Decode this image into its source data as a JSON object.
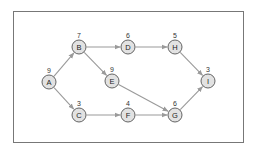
{
  "diagram": {
    "type": "directed-graph",
    "frame": {
      "x": 13,
      "y": 11,
      "width": 230,
      "height": 131
    },
    "colors": {
      "node_fill": "#e2e2e2",
      "node_stroke": "#555555",
      "edge": "#9a9a9a",
      "frame": "#777777"
    },
    "node_radius": 7,
    "nodes": [
      {
        "id": "A",
        "label": "A",
        "weight": "9",
        "x": 49,
        "y": 82
      },
      {
        "id": "B",
        "label": "B",
        "weight": "7",
        "x": 79,
        "y": 47
      },
      {
        "id": "C",
        "label": "C",
        "weight": "3",
        "x": 79,
        "y": 115
      },
      {
        "id": "D",
        "label": "D",
        "weight": "6",
        "x": 128,
        "y": 47
      },
      {
        "id": "E",
        "label": "E",
        "weight": "9",
        "x": 112,
        "y": 81
      },
      {
        "id": "F",
        "label": "F",
        "weight": "4",
        "x": 128,
        "y": 115
      },
      {
        "id": "G",
        "label": "G",
        "weight": "6",
        "x": 175,
        "y": 115
      },
      {
        "id": "H",
        "label": "H",
        "weight": "5",
        "x": 175,
        "y": 47
      },
      {
        "id": "I",
        "label": "I",
        "weight": "3",
        "x": 208,
        "y": 81
      }
    ],
    "edges": [
      {
        "from": "A",
        "to": "B"
      },
      {
        "from": "A",
        "to": "C"
      },
      {
        "from": "B",
        "to": "D"
      },
      {
        "from": "B",
        "to": "E"
      },
      {
        "from": "C",
        "to": "F"
      },
      {
        "from": "D",
        "to": "H"
      },
      {
        "from": "E",
        "to": "G"
      },
      {
        "from": "F",
        "to": "G"
      },
      {
        "from": "H",
        "to": "I"
      },
      {
        "from": "G",
        "to": "I"
      }
    ]
  }
}
